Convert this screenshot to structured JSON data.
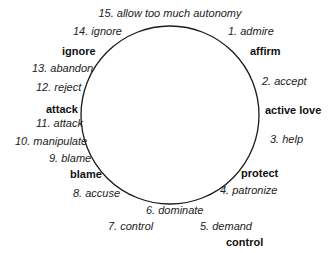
{
  "diagram": {
    "type": "circular cycle",
    "circle": {
      "cx": 170,
      "cy": 115,
      "r": 89,
      "stroke": "#1a1a1a"
    },
    "items": [
      {
        "n": 1,
        "label": "1. admire",
        "x": 228,
        "y": 26
      },
      {
        "n": 2,
        "label": "2. accept",
        "x": 262,
        "y": 76
      },
      {
        "n": 3,
        "label": "3. help",
        "x": 270,
        "y": 134
      },
      {
        "n": 4,
        "label": "4. patronize",
        "x": 220,
        "y": 185
      },
      {
        "n": 5,
        "label": "5. demand",
        "x": 200,
        "y": 221
      },
      {
        "n": 6,
        "label": "6. dominate",
        "x": 146,
        "y": 205
      },
      {
        "n": 7,
        "label": "7. control",
        "x": 108,
        "y": 221
      },
      {
        "n": 8,
        "label": "8. accuse",
        "x": 73,
        "y": 188
      },
      {
        "n": 9,
        "label": "9. blame",
        "x": 49,
        "y": 153
      },
      {
        "n": 10,
        "label": "10. manipulate",
        "x": 15,
        "y": 136
      },
      {
        "n": 11,
        "label": "11. attack",
        "x": 36,
        "y": 118
      },
      {
        "n": 12,
        "label": "12. reject",
        "x": 36,
        "y": 82
      },
      {
        "n": 13,
        "label": "13. abandon",
        "x": 32,
        "y": 63
      },
      {
        "n": 14,
        "label": "14. ignore",
        "x": 73,
        "y": 26
      },
      {
        "n": 15,
        "label": "15. allow too much autonomy",
        "x": 170,
        "y": 8
      }
    ],
    "categories": [
      {
        "label": "affirm",
        "x": 250,
        "y": 46
      },
      {
        "label": "active love",
        "x": 265,
        "y": 105
      },
      {
        "label": "protect",
        "x": 241,
        "y": 168
      },
      {
        "label": "control",
        "x": 226,
        "y": 237
      },
      {
        "label": "blame",
        "x": 70,
        "y": 169
      },
      {
        "label": "attack",
        "x": 46,
        "y": 104
      },
      {
        "label": "ignore",
        "x": 62,
        "y": 46
      }
    ]
  }
}
